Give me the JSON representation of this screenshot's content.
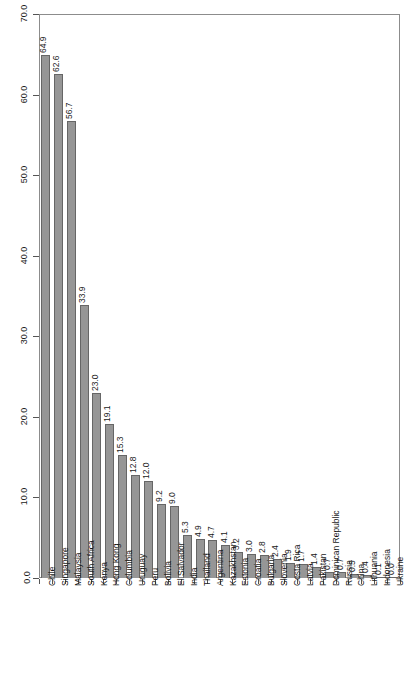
{
  "chart_data": {
    "type": "bar",
    "title": "",
    "xlabel": "",
    "ylabel": "",
    "ylim": [
      0.0,
      70.0
    ],
    "grid": false,
    "legend": false,
    "orientation": "vertical",
    "bar_color": "#969696",
    "bar_edge_color": "#666666",
    "frame_color": "#8c8c8c",
    "value_labels_rotated": true,
    "category_labels_rotated": true,
    "ytick_labels": [
      "0.0",
      "10.0",
      "20.0",
      "30.0",
      "40.0",
      "50.0",
      "60.0",
      "70.0"
    ],
    "ytick_values": [
      0.0,
      10.0,
      20.0,
      30.0,
      40.0,
      50.0,
      60.0,
      70.0
    ],
    "categories": [
      "Chile",
      "Singapore",
      "Malaysia",
      "South Africa",
      "Kenya",
      "Hong Kong",
      "Columbia",
      "Uruguay",
      "Peru",
      "Bolivia",
      "El Salvador",
      "India",
      "Thailand",
      "Argentina",
      "Kazakhstan",
      "Estonia",
      "Croatia",
      "Bulgaria",
      "Slovenia",
      "Costa Rica",
      "Latvia",
      "Pakistan",
      "Dominican Republic",
      "Russia",
      "China",
      "Lithuania",
      "Indonesia",
      "Ukraine"
    ],
    "values": [
      64.9,
      62.6,
      56.7,
      33.9,
      23.0,
      19.1,
      15.3,
      12.8,
      12.0,
      9.2,
      9.0,
      5.3,
      4.9,
      4.7,
      4.1,
      3.2,
      3.0,
      2.8,
      2.4,
      1.9,
      1.7,
      1.4,
      0.7,
      0.7,
      0.5,
      0.4,
      0.1,
      0.0
    ],
    "value_labels": [
      "64.9",
      "62.6",
      "56.7",
      "33.9",
      "23.0",
      "19.1",
      "15.3",
      "12.8",
      "12.0",
      "9.2",
      "9.0",
      "5.3",
      "4.9",
      "4.7",
      "4.1",
      "3.2",
      "3.0",
      "2.8",
      "2.4",
      "1.9",
      "1.7",
      "1.4",
      "0.7",
      "0.7",
      "0.5",
      "0.4",
      "0.1",
      "0.0"
    ]
  }
}
